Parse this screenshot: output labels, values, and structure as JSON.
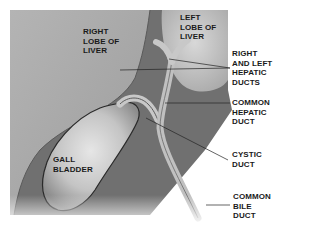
{
  "diagram": {
    "colors": {
      "background": "#ffffff",
      "liver": "#a9a9a9",
      "cavity": "#6e6e6e",
      "gallbladder": "#c9c9c9",
      "duct": "#bdbdbd",
      "text": "#1a1a1a"
    },
    "labels": {
      "right_lobe": "RIGHT\nLOBE OF\nLIVER",
      "left_lobe": "LEFT\nLOBE OF\nLIVER",
      "hepatic_ducts": "RIGHT\nAND LEFT\nHEPATIC\nDUCTS",
      "common_hepatic": "COMMON\nHEPATIC\nDUCT",
      "gall_bladder": "GALL\nBLADDER",
      "cystic_duct": "CYSTIC\nDUCT",
      "common_bile": "COMMON\nBILE\nDUCT"
    }
  }
}
